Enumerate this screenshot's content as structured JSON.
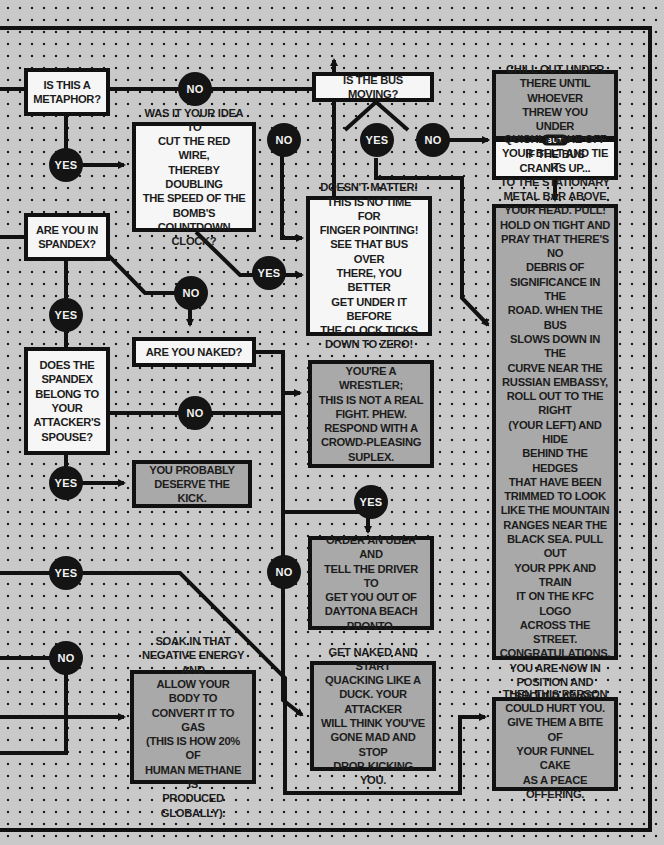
{
  "colors": {
    "background": "#c9c9c9",
    "dot": "#1a1a1a",
    "line": "#111111",
    "question_box": "#f6f6f6",
    "answer_box": "#a9a9a9",
    "badge": "#141414"
  },
  "boxes": {
    "metaphor": "IS THIS A\nMETAPHOR?",
    "bus_moving": "IS THE BUS MOVING?",
    "chill_out": "CHILL OUT UNDER\nTHERE UNTIL WHOEVER\nTHREW YOU UNDER\nTHERE LEAVES.",
    "but_label": "BUT",
    "bus_cranks": "IF THE BUS\nCRANKS UP...",
    "red_wire": "WAS IT YOUR IDEA TO\nCUT THE RED WIRE,\nTHEREBY DOUBLING\nTHE SPEED OF THE\nBOMB'S COUNTDOWN\nCLOCK?",
    "doesnt_matter": "DOESN'T MATTER!\nTHIS IS NO TIME FOR\nFINGER POINTING!\nSEE THAT BUS OVER\nTHERE, YOU BETTER\nGET UNDER IT BEFORE\nTHE CLOCK TICKS\nDOWN TO ZERO!",
    "spandex": "ARE YOU IN\nSPANDEX?",
    "belt": "QUICKLY TAKE OFF\nYOUR BELT AND TIE IT\nTO THE STATIONARY\nMETAL BAR ABOVE\nYOUR HEAD. PULL!\nHOLD ON TIGHT AND\nPRAY THAT THERE'S NO\nDEBRIS OF\nSIGNIFICANCE IN THE\nROAD. WHEN THE BUS\nSLOWS DOWN IN THE\nCURVE NEAR THE\nRUSSIAN EMBASSY,\nROLL OUT TO THE RIGHT\n(YOUR LEFT) AND HIDE\nBEHIND THE HEDGES\nTHAT HAVE BEEN\nTRIMMED TO LOOK\nLIKE THE MOUNTAIN\nRANGES NEAR THE\nBLACK SEA. PULL OUT\nYOUR PPK AND TRAIN\nIT ON THE KFC LOGO\nACROSS THE STREET.\nCONGRATULATIONS,\nYOU ARE NOW IN\nPOSITION AND\nSHOULD AWAIT\nCOMMANDS FROM\nLANGLEY.",
    "naked": "ARE YOU NAKED?",
    "spouse": "DOES THE\nSPANDEX\nBELONG TO\nYOUR\nATTACKER'S\nSPOUSE?",
    "wrestler": "YOU'RE A WRESTLER;\nTHIS IS NOT A REAL\nFIGHT. PHEW.\nRESPOND WITH A\nCROWD-PLEASING\nSUPLEX.",
    "deserve": "YOU PROBABLY\nDESERVE THE KICK.",
    "uber": "ORDER AN UBER AND\nTELL THE DRIVER TO\nGET YOU OUT OF\nDAYTONA BEACH\nPRONTO.",
    "soak": "SOAK IN THAT\nNEGATIVE ENERGY AND\nALLOW YOUR BODY TO\nCONVERT IT TO GAS\n(THIS IS HOW 20% OF\nHUMAN METHANE IS\nPRODUCED GLOBALLY).",
    "quack": "GET NAKED AND START\nQUACKING LIKE A\nDUCK. YOUR ATTACKER\nWILL THINK YOU'VE\nGONE MAD AND STOP\nDROP-KICKING YOU.",
    "funnel": "THEN THIS PERSON\nCOULD HURT YOU.\nGIVE THEM A BITE OF\nYOUR FUNNEL CAKE\nAS A PEACE OFFERING."
  },
  "badges": {
    "yes": "YES",
    "no": "NO"
  }
}
